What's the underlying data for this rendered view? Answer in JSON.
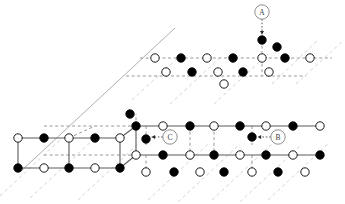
{
  "figure": {
    "type": "crystal-lattice-diagram",
    "title": "",
    "background_color": "#ffffff",
    "colors": {
      "filled_atom": "#000000",
      "open_atom_fill": "#ffffff",
      "atom_stroke": "#000000",
      "solid_bond": "#5a5a5a",
      "dashed_bond": "#8c8c8c",
      "faint_guide": "#c9c9c9",
      "callout_stroke": "#808080",
      "callout_text": "#3a3a3a"
    },
    "atom_radius": 4.2,
    "callout_radius": 7.2
  },
  "callouts": [
    {
      "id": "A",
      "label": "A",
      "cx": 262,
      "cy": 12,
      "target_x": 262,
      "target_y": 40,
      "arrow_dir": "down"
    },
    {
      "id": "B",
      "label": "B",
      "cx": 278,
      "cy": 137,
      "target_x": 252,
      "target_y": 137,
      "arrow_dir": "left"
    },
    {
      "id": "C",
      "label": "C",
      "cx": 170,
      "cy": 137,
      "target_x": 146,
      "target_y": 137,
      "arrow_dir": "left"
    }
  ],
  "guide_lines": [
    {
      "name": "upper-solid-edge",
      "x1": 20,
      "y1": 172,
      "x2": 175,
      "y2": 28,
      "style": "solid",
      "color": "#9a9a9a",
      "width": 0.8
    },
    {
      "name": "diag-faint-1",
      "x1": 0,
      "y1": 196,
      "x2": 60,
      "y2": 140,
      "style": "dashed",
      "color": "#c9c9c9",
      "width": 0.8
    },
    {
      "name": "diag-faint-2",
      "x1": 30,
      "y1": 198,
      "x2": 95,
      "y2": 138,
      "style": "dashed",
      "color": "#c9c9c9",
      "width": 0.8
    },
    {
      "name": "diag-faint-3",
      "x1": 78,
      "y1": 200,
      "x2": 140,
      "y2": 142,
      "style": "dashed",
      "color": "#c9c9c9",
      "width": 0.8
    },
    {
      "name": "diag-faint-4",
      "x1": 148,
      "y1": 200,
      "x2": 208,
      "y2": 144,
      "style": "dashed",
      "color": "#c9c9c9",
      "width": 0.8
    },
    {
      "name": "diag-faint-5",
      "x1": 178,
      "y1": 202,
      "x2": 240,
      "y2": 144,
      "style": "dashed",
      "color": "#c9c9c9",
      "width": 0.8
    },
    {
      "name": "diag-faint-6",
      "x1": 212,
      "y1": 200,
      "x2": 272,
      "y2": 144,
      "style": "dashed",
      "color": "#c9c9c9",
      "width": 0.8
    },
    {
      "name": "diag-faint-7",
      "x1": 240,
      "y1": 202,
      "x2": 300,
      "y2": 146,
      "style": "dashed",
      "color": "#c9c9c9",
      "width": 0.8
    },
    {
      "name": "diag-faint-8",
      "x1": 268,
      "y1": 200,
      "x2": 330,
      "y2": 142,
      "style": "dashed",
      "color": "#c9c9c9",
      "width": 0.8
    },
    {
      "name": "diag-upper-1",
      "x1": 132,
      "y1": 100,
      "x2": 180,
      "y2": 56,
      "style": "dashed",
      "color": "#c9c9c9",
      "width": 0.8
    },
    {
      "name": "diag-upper-2",
      "x1": 170,
      "y1": 104,
      "x2": 222,
      "y2": 56,
      "style": "dashed",
      "color": "#c9c9c9",
      "width": 0.8
    },
    {
      "name": "diag-upper-3",
      "x1": 214,
      "y1": 104,
      "x2": 268,
      "y2": 54,
      "style": "dashed",
      "color": "#c9c9c9",
      "width": 0.8
    },
    {
      "name": "diag-upper-4",
      "x1": 272,
      "y1": 84,
      "x2": 318,
      "y2": 40,
      "style": "dashed",
      "color": "#c9c9c9",
      "width": 0.8
    },
    {
      "name": "diag-upper-5",
      "x1": 296,
      "y1": 84,
      "x2": 344,
      "y2": 40,
      "style": "dashed",
      "color": "#c9c9c9",
      "width": 0.8
    }
  ],
  "bonds_solid": [
    {
      "x1": 18,
      "y1": 138,
      "x2": 120,
      "y2": 138
    },
    {
      "x1": 18,
      "y1": 168,
      "x2": 120,
      "y2": 168
    },
    {
      "x1": 18,
      "y1": 138,
      "x2": 18,
      "y2": 168
    },
    {
      "x1": 120,
      "y1": 138,
      "x2": 120,
      "y2": 168
    },
    {
      "x1": 69,
      "y1": 138,
      "x2": 69,
      "y2": 168
    },
    {
      "x1": 136,
      "y1": 126,
      "x2": 320,
      "y2": 126
    },
    {
      "x1": 136,
      "y1": 155,
      "x2": 320,
      "y2": 155
    },
    {
      "x1": 136,
      "y1": 126,
      "x2": 136,
      "y2": 155
    },
    {
      "x1": 120,
      "y1": 138,
      "x2": 136,
      "y2": 126
    },
    {
      "x1": 120,
      "y1": 168,
      "x2": 136,
      "y2": 155
    }
  ],
  "bonds_dashed": [
    {
      "x1": 44,
      "y1": 126,
      "x2": 132,
      "y2": 126
    },
    {
      "x1": 44,
      "y1": 155,
      "x2": 132,
      "y2": 155
    },
    {
      "x1": 69,
      "y1": 138,
      "x2": 95,
      "y2": 126
    },
    {
      "x1": 140,
      "y1": 58,
      "x2": 332,
      "y2": 58
    },
    {
      "x1": 126,
      "y1": 76,
      "x2": 306,
      "y2": 76
    },
    {
      "x1": 262,
      "y1": 40,
      "x2": 262,
      "y2": 58
    },
    {
      "x1": 262,
      "y1": 58,
      "x2": 262,
      "y2": 76
    },
    {
      "x1": 146,
      "y1": 126,
      "x2": 146,
      "y2": 145
    },
    {
      "x1": 190,
      "y1": 126,
      "x2": 190,
      "y2": 155
    },
    {
      "x1": 214,
      "y1": 126,
      "x2": 214,
      "y2": 155
    },
    {
      "x1": 252,
      "y1": 126,
      "x2": 252,
      "y2": 145
    },
    {
      "x1": 146,
      "y1": 155,
      "x2": 146,
      "y2": 172
    },
    {
      "x1": 252,
      "y1": 155,
      "x2": 252,
      "y2": 170
    },
    {
      "x1": 136,
      "y1": 126,
      "x2": 136,
      "y2": 114
    }
  ],
  "atoms": [
    {
      "name": "a-top-dark-A",
      "cx": 262,
      "cy": 40,
      "fill": "filled"
    },
    {
      "name": "a-upper-right-dark",
      "cx": 277,
      "cy": 47,
      "fill": "filled"
    },
    {
      "name": "r1-1",
      "cx": 155,
      "cy": 58,
      "fill": "open"
    },
    {
      "name": "r1-2",
      "cx": 181,
      "cy": 58,
      "fill": "filled"
    },
    {
      "name": "r1-3",
      "cx": 207,
      "cy": 58,
      "fill": "open"
    },
    {
      "name": "r1-4",
      "cx": 233,
      "cy": 58,
      "fill": "filled"
    },
    {
      "name": "r1-5",
      "cx": 262,
      "cy": 58,
      "fill": "open"
    },
    {
      "name": "r1-6",
      "cx": 285,
      "cy": 58,
      "fill": "filled"
    },
    {
      "name": "r1-7",
      "cx": 310,
      "cy": 58,
      "fill": "open"
    },
    {
      "name": "r2-1",
      "cx": 166,
      "cy": 72,
      "fill": "open"
    },
    {
      "name": "r2-2",
      "cx": 192,
      "cy": 72,
      "fill": "filled"
    },
    {
      "name": "r2-3",
      "cx": 218,
      "cy": 72,
      "fill": "open"
    },
    {
      "name": "r2-4",
      "cx": 243,
      "cy": 72,
      "fill": "filled"
    },
    {
      "name": "r2-5",
      "cx": 269,
      "cy": 72,
      "fill": "open"
    },
    {
      "name": "r3-1",
      "cx": 224,
      "cy": 84,
      "fill": "open"
    },
    {
      "name": "l1-1",
      "cx": 18,
      "cy": 138,
      "fill": "open"
    },
    {
      "name": "l1-2",
      "cx": 44,
      "cy": 138,
      "fill": "filled"
    },
    {
      "name": "l1-3",
      "cx": 69,
      "cy": 138,
      "fill": "open"
    },
    {
      "name": "l1-4",
      "cx": 95,
      "cy": 138,
      "fill": "filled"
    },
    {
      "name": "l1-5",
      "cx": 120,
      "cy": 138,
      "fill": "open"
    },
    {
      "name": "l2-1",
      "cx": 18,
      "cy": 168,
      "fill": "filled"
    },
    {
      "name": "l2-2",
      "cx": 44,
      "cy": 168,
      "fill": "open"
    },
    {
      "name": "l2-3",
      "cx": 69,
      "cy": 168,
      "fill": "filled"
    },
    {
      "name": "l2-4",
      "cx": 95,
      "cy": 168,
      "fill": "open"
    },
    {
      "name": "l2-5",
      "cx": 120,
      "cy": 168,
      "fill": "filled"
    },
    {
      "name": "m1-1",
      "cx": 136,
      "cy": 126,
      "fill": "filled"
    },
    {
      "name": "m1-2",
      "cx": 163,
      "cy": 126,
      "fill": "open"
    },
    {
      "name": "m1-3",
      "cx": 190,
      "cy": 126,
      "fill": "filled"
    },
    {
      "name": "m1-4",
      "cx": 214,
      "cy": 126,
      "fill": "open"
    },
    {
      "name": "m1-5",
      "cx": 240,
      "cy": 126,
      "fill": "filled"
    },
    {
      "name": "m1-6",
      "cx": 266,
      "cy": 126,
      "fill": "open"
    },
    {
      "name": "m1-7",
      "cx": 293,
      "cy": 126,
      "fill": "filled"
    },
    {
      "name": "m1-8",
      "cx": 320,
      "cy": 126,
      "fill": "open"
    },
    {
      "name": "c-target-dark",
      "cx": 146,
      "cy": 139,
      "fill": "filled"
    },
    {
      "name": "b-target-dark",
      "cx": 252,
      "cy": 137,
      "fill": "filled"
    },
    {
      "name": "m2-1",
      "cx": 136,
      "cy": 155,
      "fill": "open"
    },
    {
      "name": "m2-2",
      "cx": 163,
      "cy": 155,
      "fill": "filled"
    },
    {
      "name": "m2-3",
      "cx": 190,
      "cy": 155,
      "fill": "open"
    },
    {
      "name": "m2-4",
      "cx": 214,
      "cy": 155,
      "fill": "filled"
    },
    {
      "name": "m2-5",
      "cx": 240,
      "cy": 155,
      "fill": "open"
    },
    {
      "name": "m2-6",
      "cx": 266,
      "cy": 155,
      "fill": "filled"
    },
    {
      "name": "m2-7",
      "cx": 293,
      "cy": 155,
      "fill": "open"
    },
    {
      "name": "m2-8",
      "cx": 320,
      "cy": 155,
      "fill": "filled"
    },
    {
      "name": "m3-1",
      "cx": 146,
      "cy": 172,
      "fill": "open"
    },
    {
      "name": "m3-2",
      "cx": 174,
      "cy": 172,
      "fill": "filled"
    },
    {
      "name": "m3-3",
      "cx": 200,
      "cy": 172,
      "fill": "open"
    },
    {
      "name": "m3-4",
      "cx": 224,
      "cy": 172,
      "fill": "filled"
    },
    {
      "name": "m3-5",
      "cx": 252,
      "cy": 172,
      "fill": "open"
    },
    {
      "name": "m3-6",
      "cx": 278,
      "cy": 172,
      "fill": "filled"
    },
    {
      "name": "m3-7",
      "cx": 305,
      "cy": 172,
      "fill": "open"
    },
    {
      "name": "edge-right-extra",
      "cx": 130,
      "cy": 114,
      "fill": "filled"
    }
  ]
}
